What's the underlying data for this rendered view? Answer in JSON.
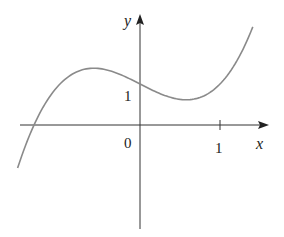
{
  "chart_data": {
    "type": "line",
    "title": "",
    "function": "y = x^3 - x + 1",
    "xlabel": "x",
    "ylabel": "y",
    "xlim": [
      -1.53,
      1.6
    ],
    "ylim": [
      -2.55,
      2.7
    ],
    "grid": false,
    "legend": null,
    "ticks": {
      "x": [
        {
          "value": 1,
          "label": "1"
        }
      ],
      "y": [
        {
          "value": 1,
          "label": "1"
        }
      ],
      "origin_label": "0"
    },
    "series": [
      {
        "name": "curve",
        "color": "#8a8a8a",
        "x": [
          -1.53,
          -1.4,
          -1.2,
          -1.0,
          -0.8,
          -0.577,
          -0.4,
          -0.2,
          0.0,
          0.2,
          0.4,
          0.577,
          0.8,
          1.0,
          1.2,
          1.41
        ],
        "y": [
          -1.05,
          -0.34,
          0.47,
          1.0,
          1.29,
          1.385,
          1.34,
          1.19,
          1.0,
          0.81,
          0.66,
          0.615,
          0.71,
          1.0,
          1.53,
          2.39
        ]
      }
    ],
    "annotations": []
  },
  "labels": {
    "x_axis": "x",
    "y_axis": "y",
    "origin": "0",
    "x_tick_1": "1",
    "y_tick_1": "1"
  },
  "colors": {
    "axis": "#333333",
    "curve": "#8a8a8a"
  }
}
